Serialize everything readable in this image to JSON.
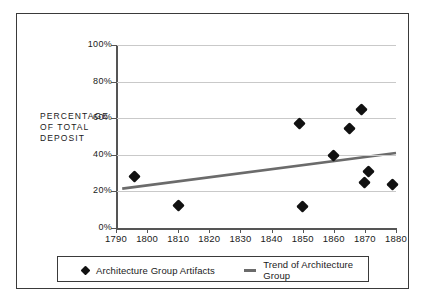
{
  "chart_data": {
    "type": "scatter",
    "title": "",
    "xlabel": "",
    "ylabel": "PERCENTAGE OF TOTAL DEPOSIT",
    "ylabel_lines": [
      "PERCENTAGE",
      "OF TOTAL",
      "DEPOSIT"
    ],
    "xlim": [
      1790,
      1880
    ],
    "ylim": [
      0,
      100
    ],
    "grid": true,
    "legend_position": "bottom",
    "xticks": [
      1790,
      1800,
      1810,
      1820,
      1830,
      1840,
      1850,
      1860,
      1870,
      1880
    ],
    "xticklabels": [
      "1790",
      "1800",
      "1810",
      "1820",
      "1830",
      "1840",
      "1850",
      "1860",
      "1870",
      "1880"
    ],
    "yticks": [
      0,
      20,
      40,
      60,
      80,
      100
    ],
    "yticklabels": [
      "0%",
      "20%",
      "40%",
      "60%",
      "80%",
      "100%"
    ],
    "series": [
      {
        "name": "Architecture Group Artifacts",
        "type": "scatter",
        "marker": "diamond",
        "color": "#111111",
        "points": [
          {
            "x": 1796,
            "y": 28
          },
          {
            "x": 1810,
            "y": 12.5
          },
          {
            "x": 1849,
            "y": 57
          },
          {
            "x": 1850,
            "y": 12
          },
          {
            "x": 1860,
            "y": 39.5
          },
          {
            "x": 1865,
            "y": 54.5
          },
          {
            "x": 1869,
            "y": 64.5
          },
          {
            "x": 1870,
            "y": 25
          },
          {
            "x": 1871,
            "y": 31
          },
          {
            "x": 1879,
            "y": 24
          }
        ]
      },
      {
        "name": "Trend of Architecture Group",
        "type": "line",
        "color": "#6b6b6b",
        "points": [
          {
            "x": 1792,
            "y": 21.5
          },
          {
            "x": 1880,
            "y": 41
          }
        ]
      }
    ]
  },
  "legend": {
    "items": [
      {
        "label": "Architecture Group Artifacts",
        "marker": "diamond"
      },
      {
        "label": "Trend of Architecture Group",
        "marker": "line"
      }
    ]
  }
}
